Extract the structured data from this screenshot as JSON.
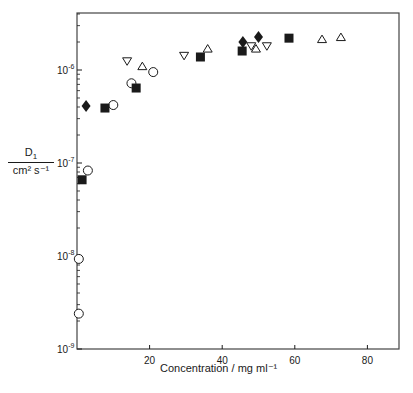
{
  "chart_data": {
    "type": "scatter",
    "title": "",
    "xlabel": "Concentration / mg ml⁻¹",
    "ylabel_numerator": "D₁",
    "ylabel_denominator": "cm² s⁻¹",
    "xlim": [
      0,
      88
    ],
    "ylim": [
      1e-09,
      4e-06
    ],
    "yscale": "log",
    "x_ticks": [
      20,
      40,
      60,
      80
    ],
    "x_tick_labels": [
      "20",
      "40",
      "60",
      "80"
    ],
    "y_ticks": [
      1e-09,
      1e-08,
      1e-07,
      1e-06
    ],
    "y_tick_labels": [
      "10⁻⁹",
      "10⁻⁸",
      "10⁻⁷",
      "10⁻⁶"
    ],
    "grid": false,
    "legend": null,
    "series": [
      {
        "name": "open-circle",
        "marker": "circle-open",
        "x": [
          0.5,
          0.5,
          3,
          10,
          15,
          21
        ],
        "y": [
          2.4e-09,
          9.3e-09,
          8.3e-08,
          4.2e-07,
          7.2e-07,
          9.5e-07
        ]
      },
      {
        "name": "filled-square",
        "marker": "square-filled",
        "x": [
          1.4,
          7.7,
          16.3,
          34,
          45.5,
          58.4
        ],
        "y": [
          6.6e-08,
          3.9e-07,
          6.4e-07,
          1.38e-06,
          1.6e-06,
          2.2e-06
        ]
      },
      {
        "name": "filled-diamond",
        "marker": "diamond-filled",
        "x": [
          2.5,
          45.7,
          50
        ],
        "y": [
          4.1e-07,
          2e-06,
          2.26e-06
        ]
      },
      {
        "name": "open-triangle-down",
        "marker": "triangle-down-open",
        "x": [
          13.8,
          29.5,
          48,
          52.3
        ],
        "y": [
          1.24e-06,
          1.42e-06,
          1.8e-06,
          1.8e-06
        ]
      },
      {
        "name": "open-triangle-up",
        "marker": "triangle-up-open",
        "x": [
          18,
          36,
          49.3,
          67.5,
          72.7
        ],
        "y": [
          1.1e-06,
          1.7e-06,
          1.7e-06,
          2.15e-06,
          2.26e-06
        ]
      }
    ]
  },
  "labels": {
    "ylabel_num": "D",
    "ylabel_num_sub": "1",
    "ylabel_den": "cm² s⁻¹",
    "xlabel": "Concentration / mg ml⁻¹"
  }
}
